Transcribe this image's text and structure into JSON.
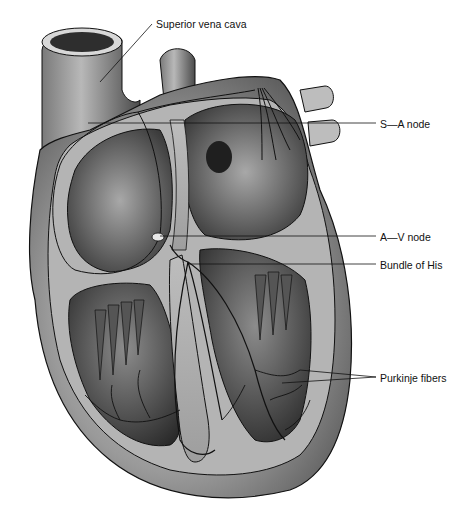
{
  "figure": {
    "labels": {
      "superior_vena_cava": "Superior vena cava",
      "sa_node": "S—A node",
      "av_node": "A—V node",
      "bundle_of_his": "Bundle of His",
      "purkinje_fibers": "Purkinje fibers"
    },
    "colors": {
      "background": "#ffffff",
      "outline": "#111111",
      "tissue_light": "#c8c8c8",
      "tissue_mid": "#8a8a8a",
      "tissue_dark": "#3a3a3a",
      "chamber_dark": "#2a2a2a"
    }
  }
}
